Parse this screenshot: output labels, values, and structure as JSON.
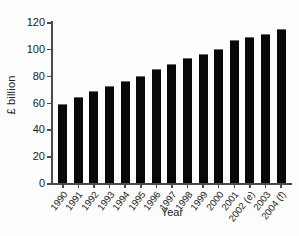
{
  "chart_data": {
    "type": "bar",
    "title": "",
    "xlabel": "Year",
    "ylabel": "£ billion",
    "categories": [
      "1990",
      "1991",
      "1992",
      "1993",
      "1994",
      "1995",
      "1996",
      "1997",
      "1998",
      "1999",
      "2000",
      "2001",
      "2002 (e)",
      "2003",
      "2004 (f)"
    ],
    "values": [
      59,
      64,
      68.5,
      72,
      76,
      80,
      85,
      89,
      93.5,
      96,
      100,
      106.5,
      109,
      111,
      115
    ],
    "ylim": [
      0,
      120
    ],
    "yticks": [
      0,
      20,
      40,
      60,
      80,
      100,
      120
    ],
    "ytick_labels": [
      "0",
      "20",
      "40",
      "60",
      "80",
      "100",
      "120"
    ],
    "grid": false,
    "legend": false,
    "bar_color": "#080808",
    "axis_color": "#4a4a4a",
    "background": "#fdfdfd"
  }
}
